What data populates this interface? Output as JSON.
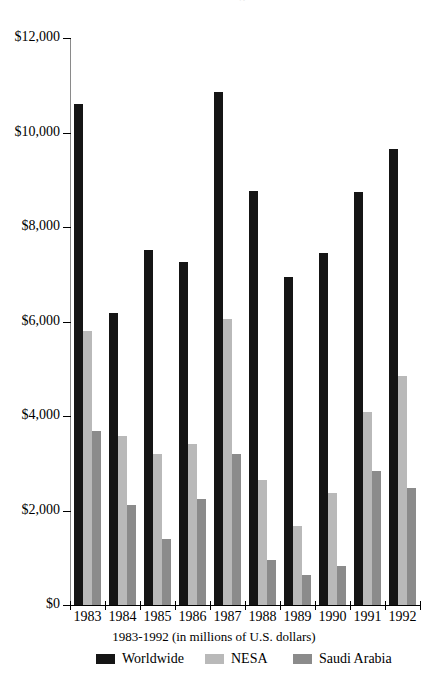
{
  "chart_data": {
    "type": "bar",
    "title": "U.S. Arms Transfer Agreements",
    "subtitle": "",
    "xlabel": "1983-1992 (in millions of U.S. dollars)",
    "ylabel": "",
    "categories": [
      "1983",
      "1984",
      "1985",
      "1986",
      "1987",
      "1988",
      "1989",
      "1990",
      "1991",
      "1992"
    ],
    "series": [
      {
        "name": "Worldwide",
        "color": "#151515",
        "values": [
          10600,
          6180,
          7520,
          7250,
          10850,
          8770,
          6950,
          7450,
          8750,
          9660
        ]
      },
      {
        "name": "NESA",
        "color": "#b9b9b9",
        "values": [
          5800,
          3580,
          3200,
          3400,
          6050,
          2650,
          1670,
          2370,
          4090,
          4840
        ]
      },
      {
        "name": "Saudi Arabia",
        "color": "#8b8b8b",
        "values": [
          3680,
          2120,
          1390,
          2240,
          3200,
          960,
          640,
          820,
          2830,
          2470
        ]
      }
    ],
    "ylim": [
      0,
      12000
    ],
    "ytick_values": [
      12000,
      10000,
      8000,
      6000,
      4000,
      2000,
      0
    ],
    "ytick_labels": [
      "$12,000",
      "$10,000",
      "$8,000",
      "$6,000",
      "$4,000",
      "$2,000",
      "$0"
    ],
    "grid": false,
    "legend_position": "bottom",
    "legend_entries": [
      "Worldwide",
      "NESA",
      "Saudi Arabia"
    ]
  }
}
